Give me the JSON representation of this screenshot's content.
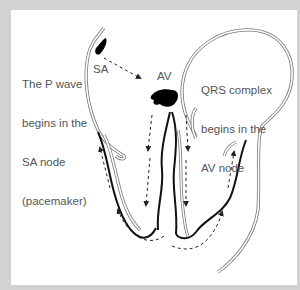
{
  "diagram": {
    "type": "heart-conduction",
    "background_color": "#d2d2d2",
    "panel_color": "#ffffff",
    "labels": {
      "left_annotation": [
        "The P wave",
        "begins in the",
        "SA node",
        "(pacemaker)"
      ],
      "right_annotation": [
        "QRS complex",
        "begins in the",
        "AV node"
      ],
      "sa_node": "SA",
      "av_node": "AV"
    },
    "nodes": [
      {
        "id": "sa-node",
        "label": "SA",
        "fill": "#000000"
      },
      {
        "id": "av-node",
        "label": "AV",
        "fill": "#000000"
      }
    ],
    "arrows": [
      {
        "from": "SA",
        "to": "AV",
        "style": "dashed"
      },
      {
        "path": "AV down left bundle",
        "style": "dashed"
      },
      {
        "path": "AV down right bundle",
        "style": "dashed"
      },
      {
        "path": "apex up left ventricle wall",
        "style": "dashed"
      },
      {
        "path": "apex up right ventricle wall",
        "style": "dashed"
      }
    ]
  }
}
